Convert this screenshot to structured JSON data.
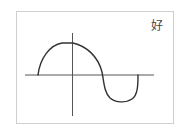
{
  "diagram": {
    "label": "好",
    "colors": {
      "frame": "#cfcfcf",
      "axis": "#555555",
      "curve": "#333333",
      "label": "#444444"
    },
    "axes": {
      "x_axis": {
        "from": [
          25,
          75
        ],
        "to": [
          154,
          75
        ]
      },
      "y_axis": {
        "from": [
          72,
          33
        ],
        "to": [
          72,
          116
        ]
      }
    },
    "curve_points": [
      {
        "name": "start",
        "x": 38,
        "y": 75
      },
      {
        "name": "peak",
        "x": 68,
        "y": 43
      },
      {
        "name": "zero-crossing",
        "x": 103,
        "y": 75
      },
      {
        "name": "trough",
        "x": 123,
        "y": 101
      },
      {
        "name": "end",
        "x": 138,
        "y": 75
      }
    ]
  }
}
